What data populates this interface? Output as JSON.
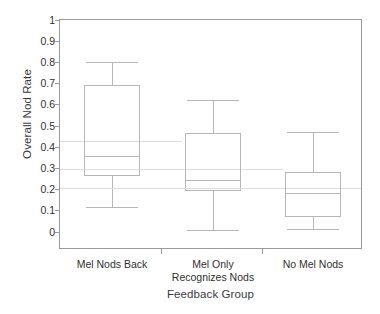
{
  "chart_data": {
    "type": "box",
    "title": "",
    "xlabel": "Feedback Group",
    "ylabel": "Overall Nod Rate",
    "ylim": [
      0,
      1
    ],
    "yticks": [
      "1",
      "0.9",
      "0.8",
      "0.7",
      "0.6",
      "0.5",
      "0.4",
      "0.3",
      "0.2",
      "0.1",
      "0"
    ],
    "ytick_values": [
      1,
      0.9,
      0.8,
      0.7,
      0.6,
      0.5,
      0.4,
      0.3,
      0.2,
      0.1,
      0
    ],
    "grid": false,
    "legend": "none",
    "categories": [
      "Mel Nods Back",
      "Mel Only Recognizes Nods",
      "No Mel Nods"
    ],
    "category_label_lines": [
      [
        "Mel Nods Back"
      ],
      [
        "Mel Only",
        "Recognizes Nods"
      ],
      [
        "No Mel Nods"
      ]
    ],
    "boxes": [
      {
        "name": "Mel Nods Back",
        "whisker_low": 0.115,
        "q1": 0.26,
        "median": 0.355,
        "q3": 0.69,
        "whisker_high": 0.8,
        "mean": 0.425
      },
      {
        "name": "Mel Only Recognizes Nods",
        "whisker_low": 0.005,
        "q1": 0.19,
        "median": 0.245,
        "q3": 0.465,
        "whisker_high": 0.62,
        "mean": 0.295
      },
      {
        "name": "No Mel Nods",
        "whisker_low": 0.01,
        "q1": 0.07,
        "median": 0.18,
        "q3": 0.28,
        "whisker_high": 0.47,
        "mean": 0.205
      }
    ],
    "colors": {
      "box_stroke": "#b6b6b6",
      "mean_line": "#dcdcdc",
      "axis": "#9a9a9a",
      "text": "#2f2f2f",
      "background": "#ffffff"
    }
  }
}
